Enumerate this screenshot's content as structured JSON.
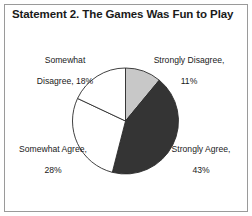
{
  "chart_data": {
    "type": "pie",
    "title": "Statement 2. The Games Was Fun to Play",
    "categories": [
      "Strongly Disagree",
      "Strongly Agree",
      "Somewhat Agree",
      "Somewhat Disagree"
    ],
    "values": [
      11,
      43,
      28,
      18
    ],
    "unit": "%",
    "start_angle_deg": 0,
    "direction": "clockwise",
    "legend": "none",
    "grid": false,
    "slices": [
      {
        "name": "strongly-disagree",
        "label_line1": "Strongly Disagree,",
        "label_line2": "11%",
        "label_text": "Strongly Disagree, 11%",
        "value": 11,
        "color": "#c8c8c8",
        "stroke": "#2b2b2b"
      },
      {
        "name": "strongly-agree",
        "label_line1": "Strongly Agree,",
        "label_line2": "43%",
        "label_text": "Strongly Agree, 43%",
        "value": 43,
        "color": "#343434",
        "stroke": "#2b2b2b"
      },
      {
        "name": "somewhat-agree",
        "label_line1": "Somewhat Agree,",
        "label_line2": "28%",
        "label_text": "Somewhat Agree, 28%",
        "value": 28,
        "color": "#ffffff",
        "stroke": "#2b2b2b"
      },
      {
        "name": "somewhat-disagree",
        "label_line1": "Somewhat",
        "label_line2": "Disagree, 18%",
        "label_text": "Somewhat Disagree, 18%",
        "value": 18,
        "color": "#ffffff",
        "stroke": "#2b2b2b"
      }
    ],
    "geometry": {
      "center_x": 125.5,
      "center_y": 121,
      "radius": 53
    },
    "colors": {
      "background": "#ffffff",
      "frame_border": "#9a9a9a",
      "text": "#1a1a1a"
    }
  }
}
